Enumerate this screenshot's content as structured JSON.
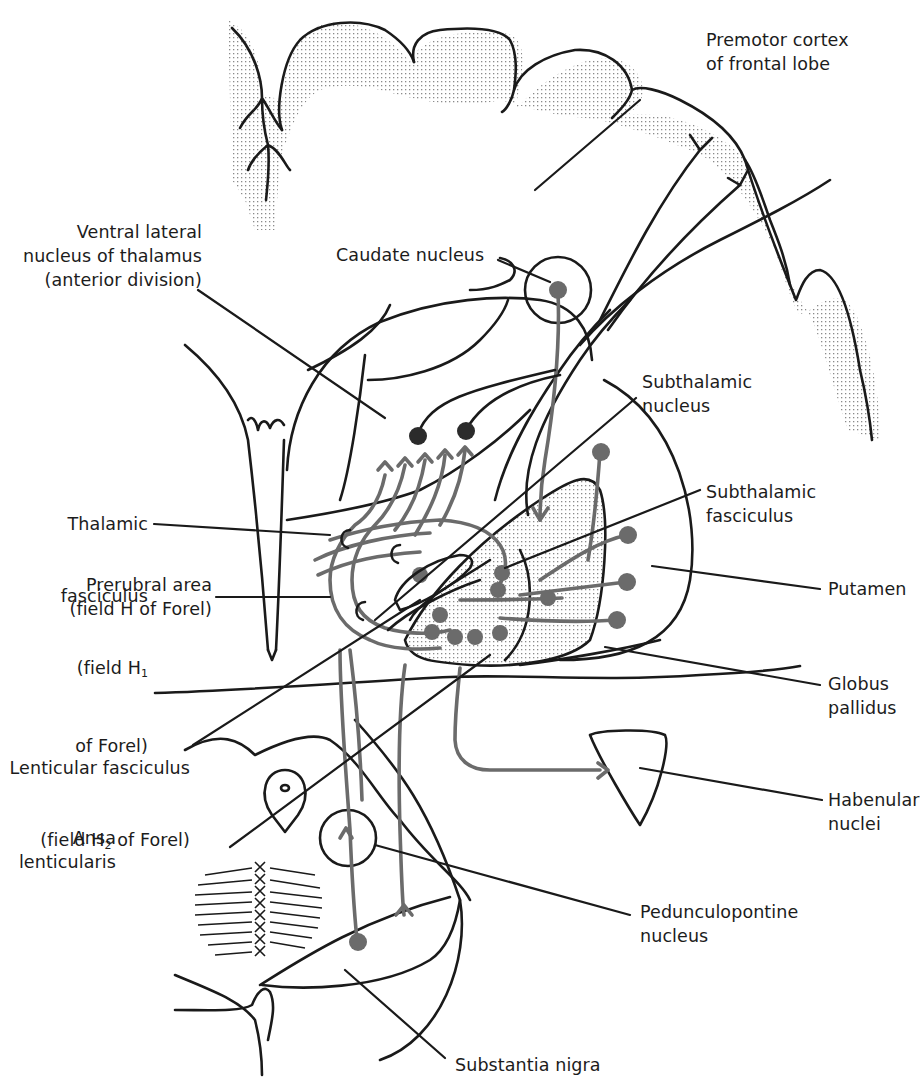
{
  "figure": {
    "colors": {
      "ink": "#1a1a1a",
      "pathway_gray": "#6b6b6b",
      "stipple": "#9a9a9a",
      "background": "#ffffff"
    }
  },
  "labels": {
    "premotor_cortex": "Premotor cortex\nof frontal lobe",
    "ventral_lateral": "Ventral lateral\nnucleus of thalamus\n(anterior division)",
    "caudate": "Caudate nucleus",
    "subthalamic_nucleus": "Subthalamic\nnucleus",
    "thalamic_fasciculus_1": "Thalamic",
    "thalamic_fasciculus_2": "fasciculus",
    "thalamic_fasciculus_3": "(field H",
    "thalamic_fasciculus_sub": "1",
    "thalamic_fasciculus_4": "of Forel)",
    "subthalamic_fasciculus": "Subthalamic\nfasciculus",
    "prerubral": "Prerubral area\n(field H of Forel)",
    "putamen": "Putamen",
    "globus_pallidus": "Globus\npallidus",
    "lenticular_1": "Lenticular fasciculus",
    "lenticular_2a": "(field H",
    "lenticular_sub": "2",
    "lenticular_2b": " of Forel)",
    "habenular": "Habenular\nnuclei",
    "ansa": "Ansa\nlenticularis",
    "pedunculopontine": "Pedunculopontine\nnucleus",
    "substantia_nigra": "Substantia nigra"
  },
  "icons": {
    "neuron_cell_body": "filled-circle",
    "axon_terminal": "forked-y-ending"
  }
}
